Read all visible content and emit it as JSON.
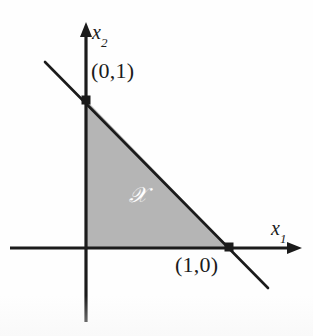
{
  "figure": {
    "kind": "math-diagram",
    "background_color": "#fefefe",
    "ink_color": "#1b1b1b",
    "region_fill_color": "#b5b5b5",
    "region_label_color": "#ffffff"
  },
  "axes": {
    "x_axis": {
      "label": "x",
      "subscript": "1",
      "label_color": "#1b1b1b",
      "arrow": "right-arrow-icon",
      "start_px": [
        10,
        248
      ],
      "end_px": [
        302,
        248
      ]
    },
    "y_axis": {
      "label": "x",
      "subscript": "2",
      "label_color": "#1b1b1b",
      "arrow": "up-arrow-icon",
      "start_px": [
        86,
        322
      ],
      "end_px": [
        86,
        22
      ]
    },
    "origin_px": [
      86,
      248
    ]
  },
  "constraint_line": {
    "name": "boundary-line",
    "start_px": [
      45,
      62
    ],
    "end_px": [
      268,
      288
    ],
    "color": "#1b1b1b",
    "width_px": 2.6
  },
  "region": {
    "name": "feasible-region",
    "label": "ᵏ",
    "label_glyph": "𝒳",
    "fill": "#b5b5b5",
    "vertices_px": [
      [
        86,
        248
      ],
      [
        86,
        100
      ],
      [
        229,
        247
      ]
    ],
    "label_px": [
      130,
      188
    ]
  },
  "points": [
    {
      "name": "vertex-0-1",
      "label": "(0,1)",
      "marker_px": [
        86,
        100
      ],
      "label_px": [
        92,
        61
      ],
      "marker": "square-dot-icon"
    },
    {
      "name": "vertex-1-0",
      "label": "(1,0)",
      "marker_px": [
        229,
        247
      ],
      "label_px": [
        176,
        255
      ],
      "marker": "square-dot-icon"
    }
  ],
  "chart_data": {
    "type": "line",
    "title": "",
    "xlabel": "x1",
    "ylabel": "x2",
    "xlim": [
      -0.53,
      1.51
    ],
    "ylim": [
      -0.5,
      1.53
    ],
    "grid": false,
    "legend": false,
    "series": [
      {
        "name": "x1 + x2 = 1",
        "x": [
          -0.29,
          1.28
        ],
        "y": [
          1.29,
          -0.28
        ]
      }
    ],
    "annotations": [
      {
        "text": "(0,1)",
        "x": 0.0,
        "y": 1.0
      },
      {
        "text": "(1,0)",
        "x": 1.0,
        "y": 0.0
      },
      {
        "text": "X",
        "x": 0.31,
        "y": 0.41
      }
    ],
    "shaded_regions": [
      {
        "name": "feasible set X",
        "polygon": [
          [
            0,
            0
          ],
          [
            0,
            1
          ],
          [
            1,
            0
          ]
        ],
        "color": "#b5b5b5"
      }
    ]
  }
}
